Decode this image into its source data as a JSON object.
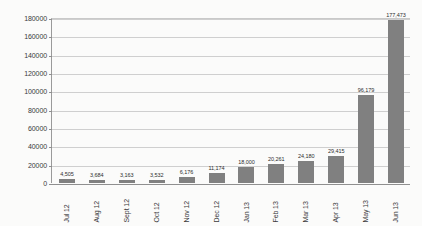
{
  "chart_data": {
    "type": "bar",
    "title": "",
    "subtitle": "",
    "xlabel": "",
    "ylabel": "",
    "categories": [
      "Jul 12",
      "Aug 12",
      "Sept 12",
      "Oct 12",
      "Nov 12",
      "Dec 12",
      "Jan 13",
      "Feb 13",
      "Mar 13",
      "Apr 13",
      "May 13",
      "Jun 13"
    ],
    "values": [
      4505,
      3684,
      3163,
      3532,
      6176,
      11174,
      18000,
      20261,
      24180,
      29415,
      96179,
      177473
    ],
    "value_labels": [
      "4,505",
      "3,684",
      "3,163",
      "3,532",
      "6,176",
      "11,174",
      "18,000",
      "20,261",
      "24,180",
      "29,415",
      "96,179",
      "177,473"
    ],
    "series": [
      {
        "name": "",
        "values": [
          4505,
          3684,
          3163,
          3532,
          6176,
          11174,
          18000,
          20261,
          24180,
          29415,
          96179,
          177473
        ]
      }
    ],
    "ylim": [
      0,
      180000
    ],
    "yticks": [
      0,
      20000,
      40000,
      60000,
      80000,
      100000,
      120000,
      140000,
      160000,
      180000
    ],
    "ytick_labels": [
      "0",
      "20000",
      "40000",
      "60000",
      "80000",
      "100000",
      "120000",
      "140000",
      "160000",
      "180000"
    ],
    "grid": true,
    "grid_axis": "y",
    "legend": false,
    "legend_position": "none",
    "data_labels": true,
    "bar_color": "#808080",
    "grid_color": "#cfcfcf",
    "axis_color": "#8f8f8f",
    "background_color": "#fbfbfa",
    "text_color": "#3a3a3a"
  }
}
